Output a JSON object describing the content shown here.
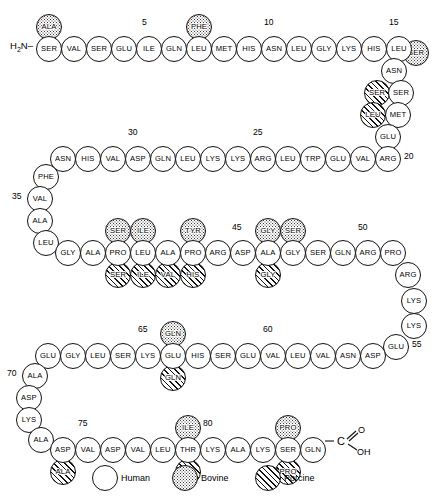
{
  "termini": {
    "n_terminus": "H2N–",
    "n_terminus_html": "H<sub>2</sub>N–",
    "c_terminus_dash": "–",
    "c_terminus_atom": "C",
    "c_terminus_o": "O",
    "c_terminus_oh": "OH"
  },
  "legend": {
    "items": [
      {
        "label": "Human",
        "species": "human",
        "fill": "plain"
      },
      {
        "label": "Bovine",
        "species": "bovine",
        "fill": "stippled"
      },
      {
        "label": "Porcine",
        "species": "porcine",
        "fill": "hatched"
      }
    ]
  },
  "number_labels": [
    "5",
    "10",
    "15",
    "20",
    "25",
    "30",
    "35",
    "45",
    "50",
    "55",
    "60",
    "65",
    "70",
    "75",
    "80"
  ],
  "residues": [
    {
      "n": 1,
      "label": "SER",
      "species": "human",
      "x": 36,
      "y": 36
    },
    {
      "n": 2,
      "label": "VAL",
      "species": "human",
      "x": 61,
      "y": 36
    },
    {
      "n": 3,
      "label": "SER",
      "species": "human",
      "x": 86,
      "y": 36
    },
    {
      "n": 4,
      "label": "GLU",
      "species": "human",
      "x": 111,
      "y": 36
    },
    {
      "n": 5,
      "label": "ILE",
      "species": "human",
      "x": 136,
      "y": 36
    },
    {
      "n": 6,
      "label": "GLN",
      "species": "human",
      "x": 161,
      "y": 36
    },
    {
      "n": 7,
      "label": "LEU",
      "species": "human",
      "x": 186,
      "y": 36
    },
    {
      "n": 8,
      "label": "MET",
      "species": "human",
      "x": 211,
      "y": 36
    },
    {
      "n": 9,
      "label": "HIS",
      "species": "human",
      "x": 236,
      "y": 36
    },
    {
      "n": 10,
      "label": "ASN",
      "species": "human",
      "x": 261,
      "y": 36
    },
    {
      "n": 11,
      "label": "LEU",
      "species": "human",
      "x": 286,
      "y": 36
    },
    {
      "n": 12,
      "label": "GLY",
      "species": "human",
      "x": 311,
      "y": 36
    },
    {
      "n": 13,
      "label": "LYS",
      "species": "human",
      "x": 336,
      "y": 36
    },
    {
      "n": 14,
      "label": "HIS",
      "species": "human",
      "x": 361,
      "y": 36
    },
    {
      "n": 15,
      "label": "LEU",
      "species": "human",
      "x": 386,
      "y": 36
    },
    {
      "n": 16,
      "label": "ASN",
      "species": "human",
      "x": 381,
      "y": 58
    },
    {
      "n": 17,
      "label": "SER",
      "species": "human",
      "x": 388,
      "y": 80
    },
    {
      "n": 18,
      "label": "MET",
      "species": "human",
      "x": 385,
      "y": 102
    },
    {
      "n": 19,
      "label": "GLU",
      "species": "human",
      "x": 375,
      "y": 124
    },
    {
      "n": 20,
      "label": "ARG",
      "species": "human",
      "x": 375,
      "y": 146
    },
    {
      "n": 21,
      "label": "VAL",
      "species": "human",
      "x": 350,
      "y": 146
    },
    {
      "n": 22,
      "label": "GLU",
      "species": "human",
      "x": 325,
      "y": 146
    },
    {
      "n": 23,
      "label": "TRP",
      "species": "human",
      "x": 300,
      "y": 146
    },
    {
      "n": 24,
      "label": "LEU",
      "species": "human",
      "x": 275,
      "y": 146
    },
    {
      "n": 25,
      "label": "ARG",
      "species": "human",
      "x": 250,
      "y": 146
    },
    {
      "n": 26,
      "label": "LYS",
      "species": "human",
      "x": 225,
      "y": 146
    },
    {
      "n": 27,
      "label": "LYS",
      "species": "human",
      "x": 200,
      "y": 146
    },
    {
      "n": 28,
      "label": "LEU",
      "species": "human",
      "x": 175,
      "y": 146
    },
    {
      "n": 29,
      "label": "GLN",
      "species": "human",
      "x": 150,
      "y": 146
    },
    {
      "n": 30,
      "label": "ASP",
      "species": "human",
      "x": 125,
      "y": 146
    },
    {
      "n": 31,
      "label": "VAL",
      "species": "human",
      "x": 100,
      "y": 146
    },
    {
      "n": 32,
      "label": "HIS",
      "species": "human",
      "x": 75,
      "y": 146
    },
    {
      "n": 33,
      "label": "ASN",
      "species": "human",
      "x": 50,
      "y": 146
    },
    {
      "n": 34,
      "label": "PHE",
      "species": "human",
      "x": 33,
      "y": 164
    },
    {
      "n": 35,
      "label": "VAL",
      "species": "human",
      "x": 27,
      "y": 186
    },
    {
      "n": 36,
      "label": "ALA",
      "species": "human",
      "x": 27,
      "y": 208
    },
    {
      "n": 37,
      "label": "LEU",
      "species": "human",
      "x": 33,
      "y": 230
    },
    {
      "n": 38,
      "label": "GLY",
      "species": "human",
      "x": 55,
      "y": 240
    },
    {
      "n": 39,
      "label": "ALA",
      "species": "human",
      "x": 80,
      "y": 240
    },
    {
      "n": 40,
      "label": "PRO",
      "species": "human",
      "x": 105,
      "y": 240
    },
    {
      "n": 41,
      "label": "LEU",
      "species": "human",
      "x": 130,
      "y": 240
    },
    {
      "n": 42,
      "label": "ALA",
      "species": "human",
      "x": 155,
      "y": 240
    },
    {
      "n": 43,
      "label": "PRO",
      "species": "human",
      "x": 180,
      "y": 240
    },
    {
      "n": 44,
      "label": "ARG",
      "species": "human",
      "x": 205,
      "y": 240
    },
    {
      "n": 45,
      "label": "ASP",
      "species": "human",
      "x": 230,
      "y": 240
    },
    {
      "n": 46,
      "label": "ALA",
      "species": "human",
      "x": 255,
      "y": 240
    },
    {
      "n": 47,
      "label": "GLY",
      "species": "human",
      "x": 280,
      "y": 240
    },
    {
      "n": 48,
      "label": "SER",
      "species": "human",
      "x": 305,
      "y": 240
    },
    {
      "n": 49,
      "label": "GLN",
      "species": "human",
      "x": 330,
      "y": 240
    },
    {
      "n": 50,
      "label": "ARG",
      "species": "human",
      "x": 355,
      "y": 240
    },
    {
      "n": 51,
      "label": "PRO",
      "species": "human",
      "x": 380,
      "y": 240
    },
    {
      "n": 52,
      "label": "ARG",
      "species": "human",
      "x": 395,
      "y": 262
    },
    {
      "n": 53,
      "label": "LYS",
      "species": "human",
      "x": 401,
      "y": 288
    },
    {
      "n": 54,
      "label": "LYS",
      "species": "human",
      "x": 401,
      "y": 313
    },
    {
      "n": 55,
      "label": "GLU",
      "species": "human",
      "x": 383,
      "y": 334
    },
    {
      "n": 56,
      "label": "ASP",
      "species": "human",
      "x": 360,
      "y": 343
    },
    {
      "n": 57,
      "label": "ASN",
      "species": "human",
      "x": 335,
      "y": 343
    },
    {
      "n": 58,
      "label": "VAL",
      "species": "human",
      "x": 310,
      "y": 343
    },
    {
      "n": 59,
      "label": "LEU",
      "species": "human",
      "x": 285,
      "y": 343
    },
    {
      "n": 60,
      "label": "VAL",
      "species": "human",
      "x": 260,
      "y": 343
    },
    {
      "n": 61,
      "label": "GLU",
      "species": "human",
      "x": 235,
      "y": 343
    },
    {
      "n": 62,
      "label": "SER",
      "species": "human",
      "x": 210,
      "y": 343
    },
    {
      "n": 63,
      "label": "HIS",
      "species": "human",
      "x": 185,
      "y": 343
    },
    {
      "n": 64,
      "label": "GLU",
      "species": "human",
      "x": 160,
      "y": 343
    },
    {
      "n": 65,
      "label": "LYS",
      "species": "human",
      "x": 135,
      "y": 343
    },
    {
      "n": 66,
      "label": "SER",
      "species": "human",
      "x": 110,
      "y": 343
    },
    {
      "n": 67,
      "label": "LEU",
      "species": "human",
      "x": 85,
      "y": 343
    },
    {
      "n": 68,
      "label": "GLY",
      "species": "human",
      "x": 60,
      "y": 343
    },
    {
      "n": 69,
      "label": "GLU",
      "species": "human",
      "x": 35,
      "y": 343
    },
    {
      "n": 70,
      "label": "ALA",
      "species": "human",
      "x": 22,
      "y": 363
    },
    {
      "n": 71,
      "label": "ASP",
      "species": "human",
      "x": 16,
      "y": 385
    },
    {
      "n": 72,
      "label": "LYS",
      "species": "human",
      "x": 16,
      "y": 407
    },
    {
      "n": 73,
      "label": "ALA",
      "species": "human",
      "x": 28,
      "y": 427
    },
    {
      "n": 74,
      "label": "ASP",
      "species": "human",
      "x": 50,
      "y": 437
    },
    {
      "n": 75,
      "label": "VAL",
      "species": "human",
      "x": 75,
      "y": 437
    },
    {
      "n": 76,
      "label": "ASP",
      "species": "human",
      "x": 100,
      "y": 437
    },
    {
      "n": 77,
      "label": "VAL",
      "species": "human",
      "x": 125,
      "y": 437
    },
    {
      "n": 78,
      "label": "LEU",
      "species": "human",
      "x": 150,
      "y": 437
    },
    {
      "n": 79,
      "label": "THR",
      "species": "human",
      "x": 175,
      "y": 437
    },
    {
      "n": 80,
      "label": "LYS",
      "species": "human",
      "x": 200,
      "y": 437
    },
    {
      "n": 81,
      "label": "ALA",
      "species": "human",
      "x": 225,
      "y": 437
    },
    {
      "n": 82,
      "label": "LYS",
      "species": "human",
      "x": 250,
      "y": 437
    },
    {
      "n": 83,
      "label": "SER",
      "species": "human",
      "x": 275,
      "y": 437
    },
    {
      "n": 84,
      "label": "GLN",
      "species": "human",
      "x": 300,
      "y": 437
    }
  ],
  "variants": [
    {
      "label": "ALA",
      "species": "bovine",
      "for": 1,
      "x": 36,
      "y": 14
    },
    {
      "label": "PHE",
      "species": "bovine",
      "for": 7,
      "x": 186,
      "y": 14
    },
    {
      "label": "SER",
      "species": "bovine",
      "for": 16,
      "x": 403,
      "y": 40
    },
    {
      "label": "SER",
      "species": "porcine",
      "for": 17,
      "x": 364,
      "y": 80
    },
    {
      "label": "LEU",
      "species": "porcine",
      "for": 18,
      "x": 360,
      "y": 102
    },
    {
      "label": "SER",
      "species": "bovine",
      "for": 40,
      "x": 105,
      "y": 218
    },
    {
      "label": "SER",
      "species": "porcine",
      "for": 40,
      "x": 105,
      "y": 262
    },
    {
      "label": "ILE",
      "species": "bovine",
      "for": 41,
      "x": 130,
      "y": 218
    },
    {
      "label": "ILE",
      "species": "porcine",
      "for": 41,
      "x": 130,
      "y": 262
    },
    {
      "label": "VAL",
      "species": "porcine",
      "for": 42,
      "x": 155,
      "y": 262
    },
    {
      "label": "TYR",
      "species": "bovine",
      "for": 43,
      "x": 180,
      "y": 218
    },
    {
      "label": "HIS",
      "species": "porcine",
      "for": 43,
      "x": 180,
      "y": 262
    },
    {
      "label": "GLY",
      "species": "bovine",
      "for": 46,
      "x": 255,
      "y": 218
    },
    {
      "label": "GLY",
      "species": "porcine",
      "for": 46,
      "x": 255,
      "y": 262
    },
    {
      "label": "SER",
      "species": "bovine",
      "for": 47,
      "x": 280,
      "y": 218
    },
    {
      "label": "GLN",
      "species": "bovine",
      "for": 64,
      "x": 160,
      "y": 321
    },
    {
      "label": "GLN",
      "species": "porcine",
      "for": 64,
      "x": 160,
      "y": 365
    },
    {
      "label": "ALA",
      "species": "porcine",
      "for": 74,
      "x": 50,
      "y": 459
    },
    {
      "label": "ILE",
      "species": "bovine",
      "for": 79,
      "x": 175,
      "y": 415
    },
    {
      "label": "ILE",
      "species": "porcine",
      "for": 79,
      "x": 175,
      "y": 459
    },
    {
      "label": "PRO",
      "species": "bovine",
      "for": 83,
      "x": 275,
      "y": 415
    },
    {
      "label": "PRO",
      "species": "porcine",
      "for": 83,
      "x": 275,
      "y": 459
    }
  ],
  "numbers": [
    {
      "text": "5",
      "x": 142,
      "y": 17
    },
    {
      "text": "10",
      "x": 264,
      "y": 17
    },
    {
      "text": "15",
      "x": 389,
      "y": 17
    },
    {
      "text": "20",
      "x": 404,
      "y": 151
    },
    {
      "text": "25",
      "x": 253,
      "y": 127
    },
    {
      "text": "30",
      "x": 128,
      "y": 127
    },
    {
      "text": "35",
      "x": 12,
      "y": 191
    },
    {
      "text": "45",
      "x": 232,
      "y": 222
    },
    {
      "text": "50",
      "x": 358,
      "y": 222
    },
    {
      "text": "55",
      "x": 412,
      "y": 339
    },
    {
      "text": "60",
      "x": 263,
      "y": 324
    },
    {
      "text": "65",
      "x": 138,
      "y": 324
    },
    {
      "text": "70",
      "x": 7,
      "y": 368
    },
    {
      "text": "75",
      "x": 78,
      "y": 418
    },
    {
      "text": "80",
      "x": 203,
      "y": 418
    }
  ]
}
